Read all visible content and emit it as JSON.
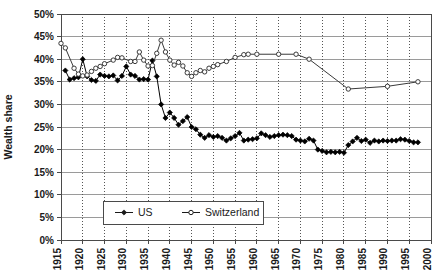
{
  "chart_data": {
    "type": "line",
    "title": "",
    "xlabel": "",
    "ylabel": "Wealth share",
    "xlim": [
      1915,
      2000
    ],
    "ylim": [
      0,
      0.5
    ],
    "y_tick_labels": [
      "0%",
      "5%",
      "10%",
      "15%",
      "20%",
      "25%",
      "30%",
      "35%",
      "40%",
      "45%",
      "50%"
    ],
    "y_tick_values": [
      0,
      5,
      10,
      15,
      20,
      25,
      30,
      35,
      40,
      45,
      50
    ],
    "x_tick_labels": [
      "1915",
      "1920",
      "1925",
      "1930",
      "1935",
      "1940",
      "1945",
      "1950",
      "1955",
      "1960",
      "1965",
      "1970",
      "1975",
      "1980",
      "1985",
      "1990",
      "1995",
      "2000"
    ],
    "x_tick_values": [
      1915,
      1920,
      1925,
      1930,
      1935,
      1940,
      1945,
      1950,
      1955,
      1960,
      1965,
      1970,
      1975,
      1980,
      1985,
      1990,
      1995,
      2000
    ],
    "grid": "horizontal-solid-and-vertical-dotted",
    "legend_position": "bottom-center",
    "series": [
      {
        "name": "US",
        "marker": "filled-diamond",
        "color": "#000000",
        "points": [
          [
            1916,
            37.5
          ],
          [
            1917,
            35.5
          ],
          [
            1918,
            35.8
          ],
          [
            1919,
            36.0
          ],
          [
            1920,
            40.0
          ],
          [
            1921,
            36.2
          ],
          [
            1922,
            35.4
          ],
          [
            1923,
            35.2
          ],
          [
            1924,
            36.6
          ],
          [
            1925,
            36.3
          ],
          [
            1926,
            36.2
          ],
          [
            1927,
            36.4
          ],
          [
            1928,
            35.3
          ],
          [
            1929,
            36.3
          ],
          [
            1930,
            38.4
          ],
          [
            1931,
            36.6
          ],
          [
            1932,
            36.3
          ],
          [
            1933,
            35.5
          ],
          [
            1934,
            35.6
          ],
          [
            1935,
            35.5
          ],
          [
            1936,
            39.7
          ],
          [
            1937,
            36.2
          ],
          [
            1938,
            30.0
          ],
          [
            1939,
            27.0
          ],
          [
            1940,
            28.2
          ],
          [
            1941,
            27.0
          ],
          [
            1942,
            25.5
          ],
          [
            1943,
            26.3
          ],
          [
            1944,
            27.2
          ],
          [
            1945,
            25.0
          ],
          [
            1946,
            24.5
          ],
          [
            1947,
            23.3
          ],
          [
            1948,
            22.6
          ],
          [
            1949,
            23.2
          ],
          [
            1950,
            22.8
          ],
          [
            1951,
            23.0
          ],
          [
            1952,
            22.6
          ],
          [
            1953,
            22.0
          ],
          [
            1954,
            22.5
          ],
          [
            1955,
            23.0
          ],
          [
            1956,
            23.7
          ],
          [
            1957,
            22.0
          ],
          [
            1958,
            22.2
          ],
          [
            1959,
            22.3
          ],
          [
            1960,
            22.5
          ],
          [
            1961,
            23.6
          ],
          [
            1962,
            23.2
          ],
          [
            1963,
            22.8
          ],
          [
            1964,
            23.0
          ],
          [
            1965,
            23.2
          ],
          [
            1966,
            23.3
          ],
          [
            1967,
            23.2
          ],
          [
            1968,
            23.0
          ],
          [
            1969,
            22.2
          ],
          [
            1970,
            22.0
          ],
          [
            1971,
            21.8
          ],
          [
            1972,
            22.4
          ],
          [
            1973,
            22.0
          ],
          [
            1974,
            20.0
          ],
          [
            1975,
            19.7
          ],
          [
            1976,
            19.4
          ],
          [
            1977,
            19.5
          ],
          [
            1978,
            19.4
          ],
          [
            1979,
            19.5
          ],
          [
            1980,
            19.3
          ],
          [
            1981,
            21.0
          ],
          [
            1982,
            21.8
          ],
          [
            1983,
            22.6
          ],
          [
            1984,
            21.9
          ],
          [
            1985,
            22.2
          ],
          [
            1986,
            21.5
          ],
          [
            1987,
            22.0
          ],
          [
            1988,
            21.8
          ],
          [
            1989,
            22.0
          ],
          [
            1990,
            21.9
          ],
          [
            1991,
            22.0
          ],
          [
            1992,
            22.0
          ],
          [
            1993,
            22.3
          ],
          [
            1994,
            22.2
          ],
          [
            1995,
            21.9
          ],
          [
            1996,
            21.6
          ],
          [
            1997,
            21.6
          ]
        ]
      },
      {
        "name": "Switzerland",
        "marker": "open-circle",
        "color": "#3a3a3a",
        "points": [
          [
            1915,
            43.5
          ],
          [
            1916,
            42.5
          ],
          [
            1918,
            38.0
          ],
          [
            1919,
            36.7
          ],
          [
            1920,
            36.3
          ],
          [
            1921,
            36.5
          ],
          [
            1922,
            37.3
          ],
          [
            1923,
            38.0
          ],
          [
            1924,
            38.4
          ],
          [
            1925,
            39.0
          ],
          [
            1927,
            39.8
          ],
          [
            1928,
            40.4
          ],
          [
            1929,
            40.3
          ],
          [
            1931,
            39.5
          ],
          [
            1932,
            39.5
          ],
          [
            1933,
            41.6
          ],
          [
            1934,
            39.8
          ],
          [
            1935,
            38.5
          ],
          [
            1936,
            38.6
          ],
          [
            1937,
            41.3
          ],
          [
            1938,
            44.2
          ],
          [
            1939,
            41.6
          ],
          [
            1940,
            39.8
          ],
          [
            1941,
            38.7
          ],
          [
            1942,
            39.3
          ],
          [
            1943,
            38.5
          ],
          [
            1944,
            37.0
          ],
          [
            1945,
            36.2
          ],
          [
            1946,
            37.0
          ],
          [
            1947,
            37.5
          ],
          [
            1948,
            37.2
          ],
          [
            1949,
            38.0
          ],
          [
            1950,
            38.4
          ],
          [
            1951,
            38.8
          ],
          [
            1953,
            39.5
          ],
          [
            1955,
            40.4
          ],
          [
            1957,
            41.0
          ],
          [
            1958,
            41.1
          ],
          [
            1960,
            41.1
          ],
          [
            1965,
            41.1
          ],
          [
            1969,
            41.1
          ],
          [
            1972,
            40.0
          ],
          [
            1981,
            33.4
          ],
          [
            1990,
            34.0
          ],
          [
            1997,
            35.0
          ]
        ]
      }
    ],
    "legend": [
      {
        "label": "US",
        "marker": "filled-diamond"
      },
      {
        "label": "Switzerland",
        "marker": "open-circle"
      }
    ]
  }
}
